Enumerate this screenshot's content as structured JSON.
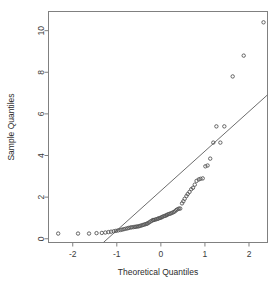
{
  "chart_data": {
    "type": "scatter",
    "title": "",
    "subtitle": "",
    "xlabel": "Theoretical Quantiles",
    "ylabel": "Sample Quantiles",
    "xlim": [
      -2.55,
      2.42
    ],
    "ylim": [
      -0.18,
      10.92
    ],
    "xticks": [
      -2,
      -1,
      0,
      1,
      2
    ],
    "xticklabels": [
      "-2",
      "-1",
      "0",
      "1",
      "2"
    ],
    "yticks": [
      0,
      2,
      4,
      6,
      8,
      10
    ],
    "yticklabels": [
      "0",
      "2",
      "4",
      "6",
      "8",
      "10"
    ],
    "grid": false,
    "legend": null,
    "marker": "open-circle",
    "marker_color": "#555555",
    "frame_color": "#808080",
    "reference_line": {
      "name": "qqline",
      "color": "#6d6d6d",
      "slope": 1.905,
      "intercept": 2.305,
      "x_start": -1.21,
      "y_start": 0.0,
      "x_end": 2.42,
      "y_end": 6.92
    },
    "series": [
      {
        "name": "Sample Quantiles",
        "x": [
          -2.33,
          -1.88,
          -1.63,
          -1.46,
          -1.34,
          -1.26,
          -1.19,
          -1.13,
          -1.07,
          -1.02,
          -0.97,
          -0.92,
          -0.88,
          -0.84,
          -0.8,
          -0.76,
          -0.73,
          -0.69,
          -0.66,
          -0.62,
          -0.59,
          -0.56,
          -0.53,
          -0.5,
          -0.47,
          -0.44,
          -0.41,
          -0.38,
          -0.35,
          -0.32,
          -0.3,
          -0.27,
          -0.24,
          -0.21,
          -0.18,
          -0.16,
          -0.13,
          -0.1,
          -0.07,
          -0.05,
          -0.02,
          0.01,
          0.03,
          0.06,
          0.09,
          0.12,
          0.14,
          0.17,
          0.2,
          0.23,
          0.26,
          0.29,
          0.32,
          0.35,
          0.38,
          0.41,
          0.44,
          0.48,
          0.51,
          0.54,
          0.58,
          0.61,
          0.65,
          0.69,
          0.73,
          0.77,
          0.81,
          0.86,
          0.9,
          0.95,
          1.01,
          1.06,
          1.12,
          1.19,
          1.26,
          1.35,
          1.44,
          1.63,
          1.88,
          2.33
        ],
        "y": [
          0.25,
          0.25,
          0.25,
          0.27,
          0.28,
          0.3,
          0.32,
          0.34,
          0.36,
          0.38,
          0.4,
          0.42,
          0.44,
          0.46,
          0.48,
          0.5,
          0.52,
          0.54,
          0.55,
          0.56,
          0.57,
          0.58,
          0.59,
          0.6,
          0.62,
          0.64,
          0.66,
          0.68,
          0.7,
          0.72,
          0.74,
          0.78,
          0.82,
          0.86,
          0.9,
          0.9,
          0.92,
          0.94,
          0.96,
          0.98,
          1.0,
          1.02,
          1.05,
          1.08,
          1.1,
          1.12,
          1.15,
          1.18,
          1.2,
          1.22,
          1.25,
          1.28,
          1.32,
          1.38,
          1.42,
          1.45,
          1.45,
          1.7,
          1.8,
          1.92,
          2.05,
          2.15,
          2.25,
          2.38,
          2.45,
          2.6,
          2.78,
          2.85,
          2.88,
          2.9,
          3.48,
          3.52,
          3.85,
          4.62,
          5.4,
          4.62,
          5.4,
          7.8,
          8.8,
          10.4
        ]
      }
    ]
  }
}
